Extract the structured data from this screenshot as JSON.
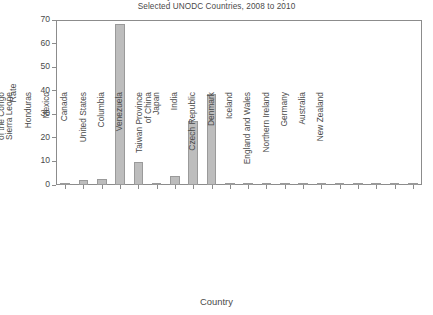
{
  "chart_data": {
    "type": "bar",
    "title": "Homicides by Firearm Rate per 100,000 Population",
    "subtitle": "Selected UNODC Countries, 2008 to 2010",
    "title_lines": [
      "Homicides by Firearm Rate per 100,000 Population",
      "Selected UNODC Countries, 2008 to 2010"
    ],
    "xlabel": "Country",
    "ylabel": "Rate",
    "ylim": [
      0,
      70
    ],
    "yticks": [
      0,
      10,
      20,
      30,
      40,
      50,
      60,
      70
    ],
    "grid": false,
    "legend": "none",
    "bar_color": "#bdbdbd",
    "bar_edge_color": "#9a9a9a",
    "axis_color": "#8c8c8c",
    "categories": [
      "Uganda",
      "Democratic Republic of the Congo",
      "Sierra Leone",
      "Honduras",
      "Mexico",
      "Canada",
      "United States",
      "Columbia",
      "Venezuela",
      "Taiwan Province of China",
      "Japan",
      "India",
      "Czech Republic",
      "Denmark",
      "Iceland",
      "England and Wales",
      "Northern Ireland",
      "Germany",
      "Australia",
      "New Zealand"
    ],
    "category_lines": [
      [
        "Uganda"
      ],
      [
        "Democratic Republic",
        "of the Congo"
      ],
      [
        "Sierra Leone"
      ],
      [
        "Honduras"
      ],
      [
        "Mexico"
      ],
      [
        "Canada"
      ],
      [
        "United States"
      ],
      [
        "Columbia"
      ],
      [
        "Venezuela"
      ],
      [
        "Taiwan Province",
        "of China"
      ],
      [
        "Japan"
      ],
      [
        "India"
      ],
      [
        "Czech Republic"
      ],
      [
        "Denmark"
      ],
      [
        "Iceland"
      ],
      [
        "England and Wales"
      ],
      [
        "Northern Ireland"
      ],
      [
        "Germany"
      ],
      [
        "Australia"
      ],
      [
        "New Zealand"
      ]
    ],
    "values": [
      0.5,
      2.0,
      2.5,
      68.5,
      9.8,
      0.5,
      3.9,
      27.0,
      38.6,
      0.6,
      0.1,
      0.3,
      0.2,
      0.3,
      0.3,
      0.2,
      0.4,
      0.2,
      0.2,
      0.2
    ],
    "series": [
      {
        "name": "Homicides by firearm rate",
        "values": [
          0.5,
          2.0,
          2.5,
          68.5,
          9.8,
          0.5,
          3.9,
          27.0,
          38.6,
          0.6,
          0.1,
          0.3,
          0.2,
          0.3,
          0.3,
          0.2,
          0.4,
          0.2,
          0.2,
          0.2
        ]
      }
    ]
  }
}
